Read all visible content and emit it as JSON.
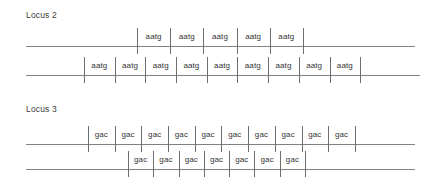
{
  "page": {
    "background_color": "#ffffff",
    "line_color": "#808080",
    "tick_color": "#6f6f6f",
    "text_color": "#3c3c3c"
  },
  "loci": [
    {
      "label": "Locus 2",
      "label_x": 26,
      "label_y": 10,
      "rows": [
        {
          "name": "locus2-allele-1",
          "line_x": 26,
          "line_width": 389,
          "row_y": 28,
          "repeat_start_x": 137,
          "cell_width": 33.2,
          "repeat_unit": "aatg",
          "repeat_count": 5,
          "repeats": [
            "aatg",
            "aatg",
            "aatg",
            "aatg",
            "aatg"
          ]
        },
        {
          "name": "locus2-allele-2",
          "line_x": 26,
          "line_width": 394,
          "row_y": 57,
          "repeat_start_x": 84,
          "cell_width": 30.7,
          "repeat_unit": "aatg",
          "repeat_count": 9,
          "repeats": [
            "aatg",
            "aatg",
            "aatg",
            "aatg",
            "aatg",
            "aatg",
            "aatg",
            "aatg",
            "aatg"
          ]
        }
      ]
    },
    {
      "label": "Locus 3",
      "label_x": 26,
      "label_y": 104,
      "rows": [
        {
          "name": "locus3-allele-1",
          "line_x": 26,
          "line_width": 389,
          "row_y": 126,
          "repeat_start_x": 88,
          "cell_width": 26.7,
          "repeat_unit": "gac",
          "repeat_count": 10,
          "repeats": [
            "gac",
            "gac",
            "gac",
            "gac",
            "gac",
            "gac",
            "gac",
            "gac",
            "gac",
            "gac"
          ]
        },
        {
          "name": "locus3-allele-2",
          "line_x": 26,
          "line_width": 389,
          "row_y": 151,
          "repeat_start_x": 128,
          "cell_width": 25.3,
          "repeat_unit": "gac",
          "repeat_count": 7,
          "repeats": [
            "gac",
            "gac",
            "gac",
            "gac",
            "gac",
            "gac",
            "gac"
          ]
        }
      ]
    }
  ]
}
